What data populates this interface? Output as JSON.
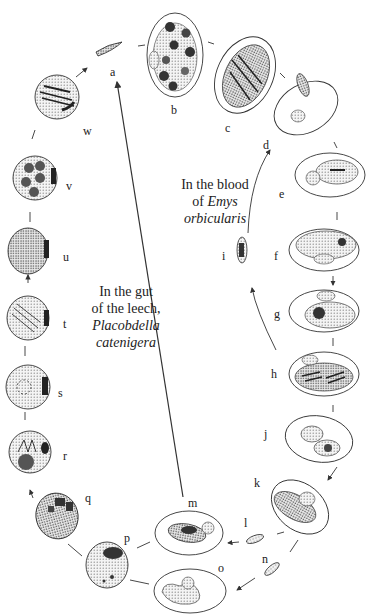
{
  "captions": {
    "blood": {
      "line1": "In the blood",
      "line2_prefix": "of ",
      "line2_italic": "Emys",
      "line3_italic": "orbicularis"
    },
    "gut": {
      "line1": "In the gut",
      "line2": "of the leech,",
      "line3_italic": "Placobdella",
      "line4_italic": "catenigera"
    }
  },
  "stages": [
    {
      "id": "a",
      "x": 110,
      "y": 66
    },
    {
      "id": "b",
      "x": 171,
      "y": 104
    },
    {
      "id": "c",
      "x": 225,
      "y": 122
    },
    {
      "id": "d",
      "x": 263,
      "y": 139
    },
    {
      "id": "e",
      "x": 279,
      "y": 188
    },
    {
      "id": "f",
      "x": 274,
      "y": 250
    },
    {
      "id": "g",
      "x": 274,
      "y": 308
    },
    {
      "id": "h",
      "x": 271,
      "y": 368
    },
    {
      "id": "i",
      "x": 222,
      "y": 250
    },
    {
      "id": "j",
      "x": 264,
      "y": 428
    },
    {
      "id": "k",
      "x": 254,
      "y": 477
    },
    {
      "id": "l",
      "x": 244,
      "y": 517
    },
    {
      "id": "m",
      "x": 188,
      "y": 497
    },
    {
      "id": "n",
      "x": 262,
      "y": 553
    },
    {
      "id": "o",
      "x": 218,
      "y": 562
    },
    {
      "id": "p",
      "x": 124,
      "y": 532
    },
    {
      "id": "q",
      "x": 85,
      "y": 492
    },
    {
      "id": "r",
      "x": 63,
      "y": 450
    },
    {
      "id": "s",
      "x": 58,
      "y": 387
    },
    {
      "id": "t",
      "x": 63,
      "y": 318
    },
    {
      "id": "u",
      "x": 63,
      "y": 251
    },
    {
      "id": "v",
      "x": 66,
      "y": 180
    },
    {
      "id": "w",
      "x": 83,
      "y": 125
    }
  ]
}
